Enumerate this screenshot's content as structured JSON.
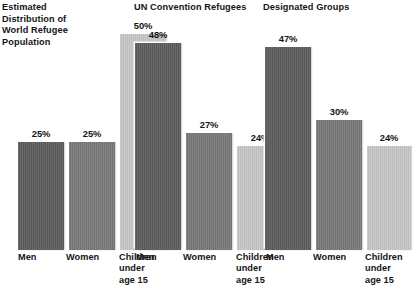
{
  "figure": {
    "background": "#ffffff",
    "width": 381,
    "height": 292
  },
  "colors": {
    "men": "#5c5c5c",
    "women": "#787878",
    "children": "#c6c6c6",
    "text": "#151515"
  },
  "chart_data": {
    "type": "bar",
    "title": "",
    "xlabel": "",
    "ylabel": "",
    "ylim": [
      0,
      50
    ],
    "grid": false,
    "legend": "none",
    "categories": [
      "Men",
      "Women",
      "Children under age 15"
    ],
    "panels": [
      {
        "title": "Estimated Distribution of World Refugee Population",
        "title_lines": "Estimated\nDistribution of\nWorld Refugee\nPopulation",
        "values": [
          25,
          25,
          50
        ],
        "labels": [
          "25%",
          "25%",
          "50%"
        ]
      },
      {
        "title": "UN Convention Refugees",
        "title_lines": "UN Convention Refugees",
        "values": [
          48,
          27,
          24
        ],
        "labels": [
          "48%",
          "27%",
          "24%"
        ]
      },
      {
        "title": "Designated Groups",
        "title_lines": "Designated Groups",
        "values": [
          47,
          30,
          24
        ],
        "labels": [
          "47%",
          "30%",
          "24%"
        ]
      }
    ],
    "category_labels": {
      "men": "Men",
      "women": "Women",
      "children": "Children\nunder\nage 15"
    }
  }
}
